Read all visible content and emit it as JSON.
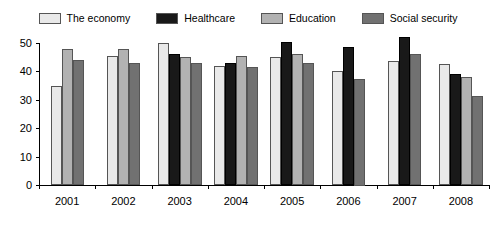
{
  "legend": {
    "position": "top-center",
    "items": [
      {
        "label": "The economy",
        "color": "#e9e9e9",
        "icon": "legend-swatch-icon"
      },
      {
        "label": "Healthcare",
        "color": "#191919",
        "icon": "legend-swatch-icon"
      },
      {
        "label": "Education",
        "color": "#b2b2b2",
        "icon": "legend-swatch-icon"
      },
      {
        "label": "Social security",
        "color": "#717171",
        "icon": "legend-swatch-icon"
      }
    ]
  },
  "axes": {
    "y_ticks": [
      "50",
      "40",
      "30",
      "20",
      "10",
      "0"
    ],
    "x_ticks": [
      "2001",
      "2002",
      "2003",
      "2004",
      "2005",
      "2006",
      "2007",
      "2008"
    ]
  },
  "chart_data": {
    "type": "bar",
    "title": "",
    "subtitle": "",
    "xlabel": "",
    "ylabel": "",
    "ylim": [
      0,
      50
    ],
    "ytick_step": 10,
    "grid": false,
    "legend_position": "top-center",
    "categories": [
      "2001",
      "2002",
      "2003",
      "2004",
      "2005",
      "2006",
      "2007",
      "2008"
    ],
    "series": [
      {
        "name": "The economy",
        "color": "#e9e9e9",
        "values": [
          35,
          45.5,
          50,
          42,
          45,
          40,
          43.5,
          42.5
        ]
      },
      {
        "name": "Healthcare",
        "color": "#191919",
        "values": [
          null,
          null,
          46,
          43,
          50.5,
          48.5,
          52,
          39
        ]
      },
      {
        "name": "Education",
        "color": "#b2b2b2",
        "values": [
          48,
          48,
          45,
          45.5,
          46,
          null,
          null,
          38
        ]
      },
      {
        "name": "Social security",
        "color": "#717171",
        "values": [
          44,
          43,
          43,
          41.5,
          43,
          37.5,
          46,
          31.5
        ]
      }
    ]
  }
}
